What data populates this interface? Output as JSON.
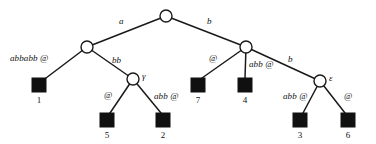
{
  "figure": {
    "kind": "suffix-tree-diagram",
    "background_color": "#ffffff",
    "stroke_color": "#1a1a1a",
    "leaf_fill_color": "#101010"
  },
  "nodes": [
    {
      "id": "root",
      "shape": "circle",
      "label": "",
      "cx": 166,
      "cy": 16
    },
    {
      "id": "n-left",
      "shape": "circle",
      "label": "",
      "cx": 87,
      "cy": 47
    },
    {
      "id": "n-right",
      "shape": "circle",
      "label": "",
      "cx": 246,
      "cy": 47
    },
    {
      "id": "n-gamma",
      "shape": "circle",
      "label": "γ",
      "cx": 133,
      "cy": 79
    },
    {
      "id": "n-eps",
      "shape": "circle",
      "label": "ε",
      "cx": 320,
      "cy": 81
    }
  ],
  "leaves": [
    {
      "id": "leaf-1",
      "number": "1",
      "cx": 39,
      "cy": 85
    },
    {
      "id": "leaf-5",
      "number": "5",
      "cx": 107,
      "cy": 120
    },
    {
      "id": "leaf-2",
      "number": "2",
      "cx": 163,
      "cy": 120
    },
    {
      "id": "leaf-7",
      "number": "7",
      "cx": 198,
      "cy": 85
    },
    {
      "id": "leaf-4",
      "number": "4",
      "cx": 245,
      "cy": 85
    },
    {
      "id": "leaf-3",
      "number": "3",
      "cx": 300,
      "cy": 120
    },
    {
      "id": "leaf-6",
      "number": "6",
      "cx": 348,
      "cy": 120
    }
  ],
  "edges": [
    {
      "id": "edge-root-left",
      "from": "root",
      "to": "n-left",
      "label": "a",
      "label_x": 119,
      "label_y": 17
    },
    {
      "id": "edge-root-right",
      "from": "root",
      "to": "n-right",
      "label": "b",
      "label_x": 207,
      "label_y": 17
    },
    {
      "id": "edge-left-leaf1",
      "from": "n-left",
      "to": "leaf-1",
      "label": "abbabb @",
      "label_x": 10,
      "label_y": 54
    },
    {
      "id": "edge-left-gamma",
      "from": "n-left",
      "to": "n-gamma",
      "label": "bb",
      "label_x": 112,
      "label_y": 56
    },
    {
      "id": "edge-gamma-leaf5",
      "from": "n-gamma",
      "to": "leaf-5",
      "label": "@",
      "label_x": 104,
      "label_y": 91
    },
    {
      "id": "edge-gamma-leaf2",
      "from": "n-gamma",
      "to": "leaf-2",
      "label": "abb @",
      "label_x": 154,
      "label_y": 92
    },
    {
      "id": "edge-right-leaf7",
      "from": "n-right",
      "to": "leaf-7",
      "label": "@",
      "label_x": 209,
      "label_y": 54
    },
    {
      "id": "edge-right-leaf4",
      "from": "n-right",
      "to": "leaf-4",
      "label": "abb @",
      "label_x": 249,
      "label_y": 60
    },
    {
      "id": "edge-right-eps",
      "from": "n-right",
      "to": "n-eps",
      "label": "b",
      "label_x": 288,
      "label_y": 55
    },
    {
      "id": "edge-eps-leaf3",
      "from": "n-eps",
      "to": "leaf-3",
      "label": "abb @",
      "label_x": 283,
      "label_y": 92
    },
    {
      "id": "edge-eps-leaf6",
      "from": "n-eps",
      "to": "leaf-6",
      "label": "@",
      "label_x": 344,
      "label_y": 92
    }
  ]
}
